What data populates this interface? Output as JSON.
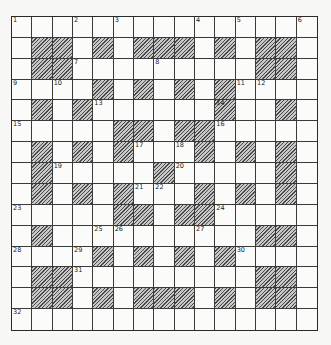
{
  "puzzle": {
    "rows": 15,
    "cols": 15,
    "colors": {
      "black_hatch": "#4a4a4a",
      "hatch_light": "#c8c8c8",
      "white": "#fbfbf9",
      "line": "#3a3a3a"
    },
    "grid": [
      "...............",
      ".##.#.###.#.##.",
      ".##.........##.",
      "....#.#.#.#....",
      ".#.#......#..#.",
      ".....##.##.....",
      ".#.#.#...#.#.#.",
      ".#.....#.....#.",
      ".#.#.#...#.#.#.",
      ".....##.##.....",
      ".#..........##.",
      "....#.#.#.#....",
      ".##.........##.",
      ".##.#.###.#.##.",
      "..............."
    ],
    "numbers": [
      {
        "r": 0,
        "c": 0,
        "n": "1"
      },
      {
        "r": 0,
        "c": 3,
        "n": "2"
      },
      {
        "r": 0,
        "c": 5,
        "n": "3"
      },
      {
        "r": 0,
        "c": 9,
        "n": "4"
      },
      {
        "r": 0,
        "c": 11,
        "n": "5"
      },
      {
        "r": 0,
        "c": 14,
        "n": "6"
      },
      {
        "r": 2,
        "c": 3,
        "n": "7"
      },
      {
        "r": 2,
        "c": 7,
        "n": "8"
      },
      {
        "r": 3,
        "c": 0,
        "n": "9"
      },
      {
        "r": 3,
        "c": 2,
        "n": "10"
      },
      {
        "r": 3,
        "c": 11,
        "n": "11"
      },
      {
        "r": 3,
        "c": 12,
        "n": "12"
      },
      {
        "r": 4,
        "c": 4,
        "n": "13"
      },
      {
        "r": 4,
        "c": 10,
        "n": "14"
      },
      {
        "r": 5,
        "c": 0,
        "n": "15"
      },
      {
        "r": 5,
        "c": 10,
        "n": "16"
      },
      {
        "r": 6,
        "c": 6,
        "n": "17"
      },
      {
        "r": 6,
        "c": 8,
        "n": "18"
      },
      {
        "r": 7,
        "c": 2,
        "n": "19"
      },
      {
        "r": 7,
        "c": 8,
        "n": "20"
      },
      {
        "r": 8,
        "c": 6,
        "n": "21"
      },
      {
        "r": 8,
        "c": 7,
        "n": "22"
      },
      {
        "r": 9,
        "c": 0,
        "n": "23"
      },
      {
        "r": 9,
        "c": 10,
        "n": "24"
      },
      {
        "r": 10,
        "c": 4,
        "n": "25"
      },
      {
        "r": 10,
        "c": 5,
        "n": "26"
      },
      {
        "r": 10,
        "c": 9,
        "n": "27"
      },
      {
        "r": 11,
        "c": 0,
        "n": "28"
      },
      {
        "r": 11,
        "c": 3,
        "n": "29"
      },
      {
        "r": 11,
        "c": 11,
        "n": "30"
      },
      {
        "r": 12,
        "c": 3,
        "n": "31"
      },
      {
        "r": 14,
        "c": 0,
        "n": "32"
      }
    ]
  }
}
